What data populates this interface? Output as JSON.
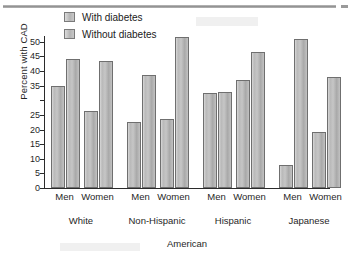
{
  "chart_data": {
    "type": "bar",
    "title": "",
    "xlabel": "American",
    "ylabel": "Percent with CAD",
    "ylim": [
      0,
      52
    ],
    "ytick_labels": [
      "50",
      "45",
      "40",
      "35",
      "",
      "25",
      "20",
      "15",
      "10",
      "5",
      "0"
    ],
    "ytick_values": [
      50,
      45,
      40,
      35,
      30,
      25,
      20,
      15,
      10,
      5,
      0
    ],
    "grid": false,
    "legend_position": "top-left",
    "categories": [
      "White Men",
      "White Women",
      "Non-Hispanic Men",
      "Non-Hispanic Women",
      "Hispanic Men",
      "Hispanic Women",
      "Japanese Men",
      "Japanese Women"
    ],
    "sex_labels": [
      "Men",
      "Women",
      "Men",
      "Women",
      "Men",
      "Women",
      "Men",
      "Women"
    ],
    "group_labels": [
      "White",
      "Non-Hispanic",
      "Hispanic",
      "Japanese"
    ],
    "series": [
      {
        "name": "With diabetes",
        "values": [
          35.0,
          26.5,
          22.5,
          23.5,
          32.5,
          37.0,
          8.0,
          19.0
        ]
      },
      {
        "name": "Without diabetes",
        "values": [
          44.0,
          43.5,
          38.5,
          51.5,
          33.0,
          46.5,
          51.0,
          38.0
        ]
      }
    ]
  },
  "legend": {
    "items": [
      {
        "label": "With diabetes"
      },
      {
        "label": "Without diabetes"
      }
    ]
  },
  "axis": {
    "y_title": "Percent with CAD",
    "x_title": "American"
  }
}
